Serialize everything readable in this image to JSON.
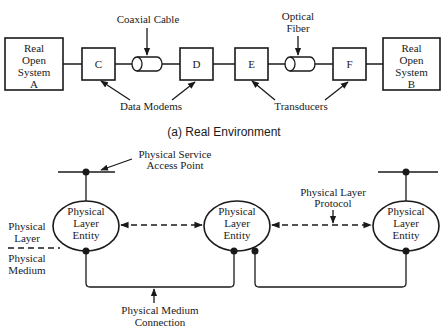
{
  "real_environment": {
    "caption": "(a) Real Environment",
    "system_a": {
      "lines": [
        "Real",
        "Open",
        "System",
        "A"
      ]
    },
    "system_b": {
      "lines": [
        "Real",
        "Open",
        "System",
        "B"
      ]
    },
    "nodes": {
      "c": "C",
      "d": "D",
      "e": "E",
      "f": "F"
    },
    "coaxial_label": "Coaxial Cable",
    "optical_label": [
      "Optical",
      "Fiber"
    ],
    "modems_label": "Data Modems",
    "transducers_label": "Transducers"
  },
  "model": {
    "sap_label": [
      "Physical Service",
      "Access Point"
    ],
    "protocol_label": [
      "Physical Layer",
      "Protocol"
    ],
    "entity_label": [
      "Physical",
      "Layer",
      "Entity"
    ],
    "layer_label": [
      "Physical",
      "Layer"
    ],
    "medium_label": [
      "Physical",
      "Medium"
    ],
    "connection_label": [
      "Physical Medium",
      "Connection"
    ]
  }
}
